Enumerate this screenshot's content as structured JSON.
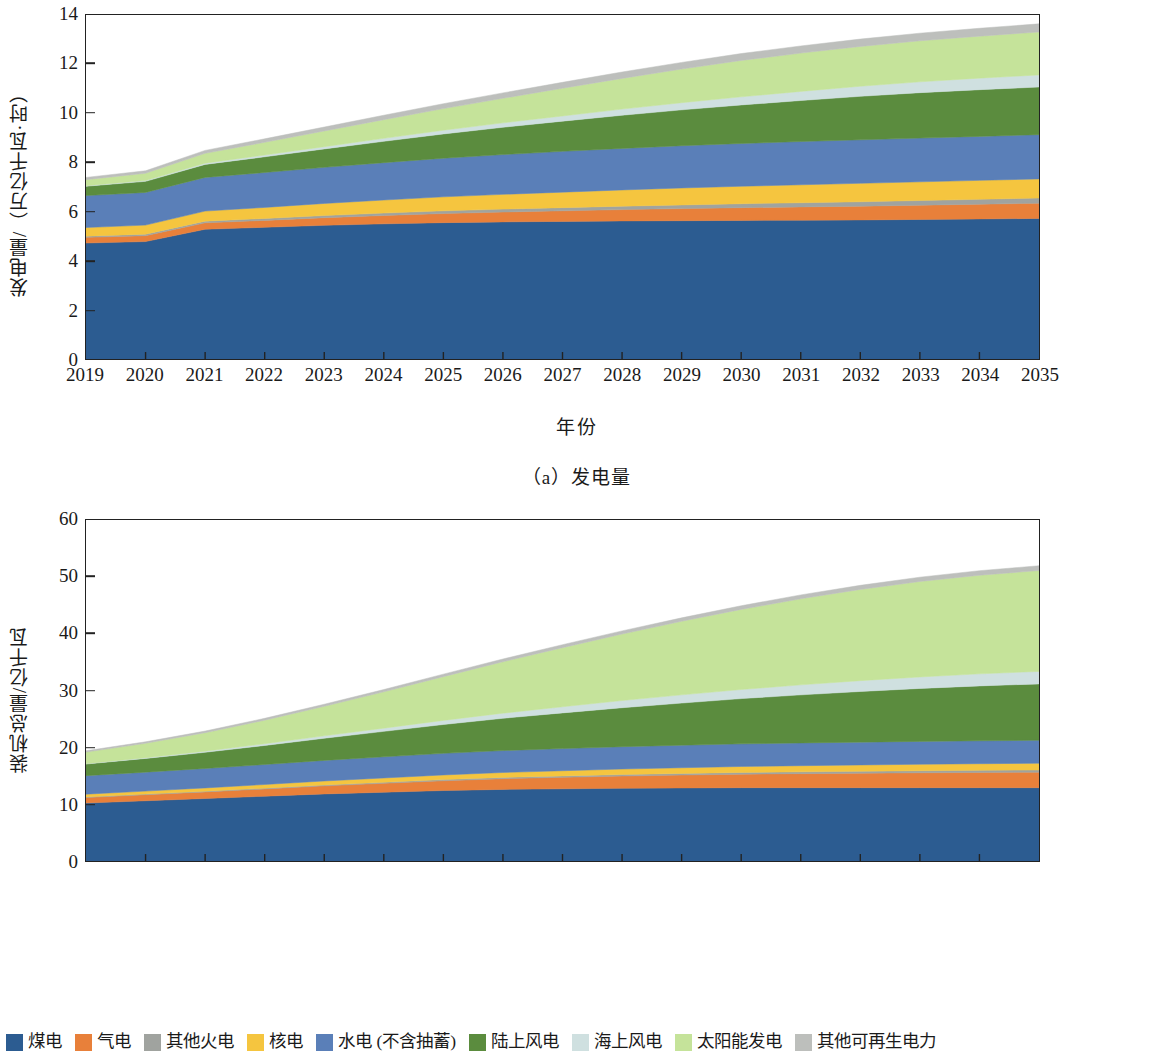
{
  "figure": {
    "xaxis_title": "年份",
    "caption_a": "（a）发电量",
    "caption_b": "（b）装机总量"
  },
  "legend": {
    "items": [
      {
        "label": "煤电",
        "color": "#2c5c91"
      },
      {
        "label": "气电",
        "color": "#e8803a"
      },
      {
        "label": "其他火电",
        "color": "#a0a39f"
      },
      {
        "label": "核电",
        "color": "#f5c53f"
      },
      {
        "label": "水电 (不含抽蓄)",
        "color": "#5a7fb8"
      },
      {
        "label": "陆上风电",
        "color": "#5b8c3e"
      },
      {
        "label": "海上风电",
        "color": "#cfe0e0"
      },
      {
        "label": "太阳能发电",
        "color": "#c5e39a"
      },
      {
        "label": "其他可再生电力",
        "color": "#bdbfbc"
      }
    ]
  },
  "chart_data": [
    {
      "id": "a",
      "type": "area",
      "stacked": true,
      "title": "（a）发电量",
      "xlabel": "年份",
      "ylabel": "发电量/（万亿千瓦·时）",
      "grid": false,
      "legend_position": "bottom",
      "xlim": [
        2019,
        2035
      ],
      "ylim": [
        0,
        14
      ],
      "yticks": [
        0,
        2,
        4,
        6,
        8,
        10,
        12,
        14
      ],
      "x": [
        2019,
        2020,
        2021,
        2022,
        2023,
        2024,
        2025,
        2026,
        2027,
        2028,
        2029,
        2030,
        2031,
        2032,
        2033,
        2034,
        2035
      ],
      "series": [
        {
          "name": "煤电",
          "color": "#2c5c91",
          "values": [
            4.72,
            4.78,
            5.28,
            5.36,
            5.44,
            5.5,
            5.55,
            5.58,
            5.6,
            5.62,
            5.63,
            5.64,
            5.65,
            5.66,
            5.68,
            5.7,
            5.72
          ]
        },
        {
          "name": "气电",
          "color": "#e8803a",
          "values": [
            0.23,
            0.24,
            0.26,
            0.28,
            0.31,
            0.34,
            0.37,
            0.4,
            0.43,
            0.46,
            0.49,
            0.52,
            0.54,
            0.56,
            0.58,
            0.6,
            0.62
          ]
        },
        {
          "name": "其他火电",
          "color": "#a0a39f",
          "values": [
            0.05,
            0.06,
            0.07,
            0.08,
            0.09,
            0.1,
            0.11,
            0.12,
            0.13,
            0.14,
            0.15,
            0.16,
            0.17,
            0.18,
            0.19,
            0.2,
            0.21
          ]
        },
        {
          "name": "核电",
          "color": "#f5c53f",
          "values": [
            0.35,
            0.37,
            0.41,
            0.45,
            0.49,
            0.53,
            0.57,
            0.6,
            0.63,
            0.66,
            0.69,
            0.71,
            0.73,
            0.75,
            0.76,
            0.77,
            0.78
          ]
        },
        {
          "name": "水电 (不含抽蓄)",
          "color": "#5a7fb8",
          "values": [
            1.3,
            1.33,
            1.37,
            1.42,
            1.47,
            1.52,
            1.57,
            1.62,
            1.66,
            1.69,
            1.72,
            1.74,
            1.76,
            1.77,
            1.78,
            1.79,
            1.8
          ]
        },
        {
          "name": "陆上风电",
          "color": "#5b8c3e",
          "values": [
            0.38,
            0.45,
            0.53,
            0.64,
            0.75,
            0.87,
            0.99,
            1.11,
            1.23,
            1.35,
            1.46,
            1.57,
            1.67,
            1.77,
            1.85,
            1.9,
            1.94
          ]
        },
        {
          "name": "海上风电",
          "color": "#cfe0e0",
          "values": [
            0.02,
            0.03,
            0.05,
            0.07,
            0.09,
            0.12,
            0.15,
            0.18,
            0.21,
            0.25,
            0.29,
            0.33,
            0.37,
            0.41,
            0.44,
            0.47,
            0.49
          ]
        },
        {
          "name": "太阳能发电",
          "color": "#c5e39a",
          "values": [
            0.25,
            0.3,
            0.4,
            0.52,
            0.64,
            0.76,
            0.88,
            1.0,
            1.13,
            1.25,
            1.37,
            1.48,
            1.56,
            1.62,
            1.67,
            1.71,
            1.75
          ]
        },
        {
          "name": "其他可再生电力",
          "color": "#bdbfbc",
          "values": [
            0.09,
            0.1,
            0.12,
            0.14,
            0.16,
            0.18,
            0.2,
            0.22,
            0.24,
            0.26,
            0.27,
            0.28,
            0.29,
            0.3,
            0.31,
            0.32,
            0.33
          ]
        }
      ],
      "totals": [
        7.39,
        7.66,
        8.49,
        8.96,
        9.44,
        9.92,
        10.39,
        10.83,
        11.26,
        11.68,
        12.07,
        12.43,
        12.74,
        13.02,
        13.26,
        13.46,
        13.64
      ]
    },
    {
      "id": "b",
      "type": "area",
      "stacked": true,
      "title": "（b）装机总量",
      "xlabel": "年份",
      "ylabel": "装机总量/亿千瓦",
      "grid": false,
      "legend_position": "bottom",
      "xlim": [
        2019,
        2035
      ],
      "ylim": [
        0,
        60
      ],
      "yticks": [
        0,
        10,
        20,
        30,
        40,
        50,
        60
      ],
      "x": [
        2019,
        2020,
        2021,
        2022,
        2023,
        2024,
        2025,
        2026,
        2027,
        2028,
        2029,
        2030,
        2031,
        2032,
        2033,
        2034,
        2035
      ],
      "series": [
        {
          "name": "煤电",
          "color": "#2c5c91",
          "values": [
            10.2,
            10.6,
            11.0,
            11.4,
            11.8,
            12.1,
            12.4,
            12.6,
            12.7,
            12.8,
            12.85,
            12.9,
            12.9,
            12.9,
            12.9,
            12.9,
            12.9
          ]
        },
        {
          "name": "气电",
          "color": "#e8803a",
          "values": [
            0.97,
            1.06,
            1.16,
            1.28,
            1.42,
            1.57,
            1.72,
            1.88,
            2.02,
            2.15,
            2.27,
            2.38,
            2.47,
            2.55,
            2.62,
            2.68,
            2.72
          ]
        },
        {
          "name": "其他火电",
          "color": "#a0a39f",
          "values": [
            0.1,
            0.11,
            0.12,
            0.14,
            0.16,
            0.18,
            0.2,
            0.22,
            0.24,
            0.26,
            0.28,
            0.3,
            0.32,
            0.34,
            0.36,
            0.38,
            0.4
          ]
        },
        {
          "name": "核电",
          "color": "#f5c53f",
          "values": [
            0.49,
            0.53,
            0.58,
            0.64,
            0.7,
            0.76,
            0.82,
            0.87,
            0.92,
            0.97,
            1.01,
            1.05,
            1.08,
            1.11,
            1.14,
            1.16,
            1.18
          ]
        },
        {
          "name": "水电 (不含抽蓄)",
          "color": "#5a7fb8",
          "values": [
            3.26,
            3.33,
            3.42,
            3.52,
            3.62,
            3.72,
            3.8,
            3.86,
            3.9,
            3.93,
            3.96,
            3.98,
            4.0,
            4.01,
            4.02,
            4.03,
            4.04
          ]
        },
        {
          "name": "陆上风电",
          "color": "#5b8c3e",
          "values": [
            2.04,
            2.42,
            2.85,
            3.35,
            3.9,
            4.48,
            5.08,
            5.68,
            6.28,
            6.86,
            7.42,
            7.96,
            8.46,
            8.92,
            9.32,
            9.66,
            9.92
          ]
        },
        {
          "name": "海上风电",
          "color": "#cfe0e0",
          "values": [
            0.07,
            0.12,
            0.2,
            0.3,
            0.42,
            0.56,
            0.72,
            0.9,
            1.08,
            1.26,
            1.44,
            1.6,
            1.76,
            1.9,
            2.02,
            2.12,
            2.2
          ]
        },
        {
          "name": "太阳能发电",
          "color": "#c5e39a",
          "values": [
            2.04,
            2.55,
            3.25,
            4.15,
            5.2,
            6.4,
            7.7,
            9.05,
            10.4,
            11.7,
            12.95,
            14.1,
            15.15,
            16.05,
            16.8,
            17.35,
            17.75
          ]
        },
        {
          "name": "其他可再生电力",
          "color": "#bdbfbc",
          "values": [
            0.22,
            0.25,
            0.28,
            0.32,
            0.36,
            0.4,
            0.44,
            0.48,
            0.52,
            0.56,
            0.6,
            0.64,
            0.68,
            0.72,
            0.76,
            0.8,
            0.84
          ]
        }
      ],
      "totals": [
        19.39,
        20.97,
        22.86,
        25.1,
        27.58,
        30.17,
        32.88,
        35.54,
        38.06,
        40.49,
        42.78,
        44.91,
        46.82,
        48.5,
        49.94,
        51.08,
        51.95
      ]
    }
  ]
}
